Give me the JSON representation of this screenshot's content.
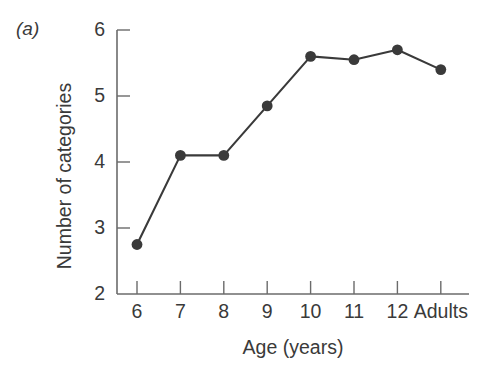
{
  "panel": {
    "label": "(a)"
  },
  "chart_data": {
    "type": "line",
    "title": "",
    "panel_label": "(a)",
    "xlabel": "Age (years)",
    "ylabel": "Number of categories",
    "categories": [
      "6",
      "7",
      "8",
      "9",
      "10",
      "11",
      "12",
      "Adults"
    ],
    "values": [
      2.75,
      4.1,
      4.1,
      4.85,
      5.6,
      5.55,
      5.7,
      5.4
    ],
    "series": [
      {
        "name": "Number of categories",
        "values": [
          2.75,
          4.1,
          4.1,
          4.85,
          5.6,
          5.55,
          5.7,
          5.4
        ]
      }
    ],
    "ylim": [
      2,
      6
    ],
    "yticks": [
      "6",
      "5",
      "4",
      "3",
      "2"
    ],
    "ytick_values": [
      6,
      5,
      4,
      3,
      2
    ],
    "xtick_labels": [
      "6",
      "7",
      "8",
      "9",
      "10",
      "11",
      "12",
      "Adults"
    ],
    "grid": false,
    "legend": "none",
    "marker": "filled-circle",
    "line_color": "#3a3a3a",
    "marker_color": "#3a3a3a",
    "axis_color": "#6b6b6b",
    "background": "#ffffff"
  }
}
